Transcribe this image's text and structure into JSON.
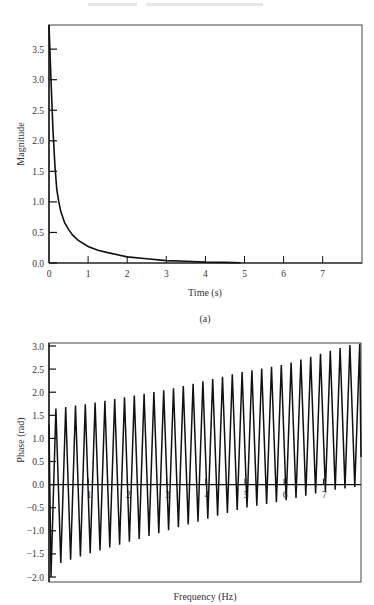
{
  "chart_data": [
    {
      "type": "line",
      "panel": "(a)",
      "title": "",
      "xlabel": "Time (s)",
      "ylabel": "Magnitude",
      "xlim": [
        0,
        8
      ],
      "ylim": [
        0,
        3.9
      ],
      "xticks": [
        "0",
        "1",
        "2",
        "3",
        "4",
        "5",
        "6",
        "7"
      ],
      "yticks": [
        "0.0",
        "0.5",
        "1.0",
        "1.5",
        "2.0",
        "2.5",
        "3.0",
        "3.5"
      ],
      "grid": false,
      "legend": null,
      "series": [
        {
          "name": "magnitude",
          "x": [
            0,
            0.05,
            0.1,
            0.15,
            0.2,
            0.25,
            0.3,
            0.4,
            0.5,
            0.6,
            0.75,
            1.0,
            1.25,
            1.5,
            2.0,
            2.5,
            3.0,
            3.5,
            4.0,
            4.5,
            4.9
          ],
          "y": [
            3.9,
            3.0,
            2.2,
            1.6,
            1.2,
            1.0,
            0.85,
            0.66,
            0.55,
            0.46,
            0.37,
            0.27,
            0.21,
            0.17,
            0.1,
            0.07,
            0.04,
            0.03,
            0.015,
            0.01,
            0.005
          ]
        }
      ]
    },
    {
      "type": "line",
      "panel": "(b)",
      "title": "",
      "xlabel": "Frequency (Hz)",
      "ylabel": "Phase (rad)",
      "xlim": [
        0,
        8
      ],
      "ylim": [
        -2.1,
        3.05
      ],
      "xticks": [
        "1",
        "2",
        "3",
        "4",
        "5",
        "6",
        "7"
      ],
      "yticks": [
        "-2.0",
        "-1.5",
        "-1.0",
        "-0.5",
        "0.0",
        "0.5",
        "1.0",
        "1.5",
        "2.0",
        "2.5",
        "3.0"
      ],
      "grid": false,
      "zero_line": true,
      "legend": null,
      "description": "Sawtooth-like oscillating phase, ~4 cycles per Hz; peak envelope rises linearly from ~1.65 to ~3.05, trough envelope rises from ~-2.0 to ~-0.05",
      "cycles_per_hz": 4,
      "series": [
        {
          "name": "peak_envelope",
          "x": [
            0.2,
            1,
            2,
            3,
            4,
            5,
            6,
            7,
            7.8
          ],
          "y": [
            1.65,
            1.75,
            1.9,
            2.05,
            2.25,
            2.45,
            2.6,
            2.85,
            3.05
          ]
        },
        {
          "name": "trough_envelope",
          "x": [
            0.05,
            0.3,
            1,
            2,
            3,
            4,
            5,
            6,
            7,
            7.8
          ],
          "y": [
            -2.0,
            -1.7,
            -1.5,
            -1.25,
            -1.0,
            -0.75,
            -0.5,
            -0.35,
            -0.15,
            -0.05
          ]
        }
      ]
    }
  ],
  "captions": {
    "top": "(a)"
  }
}
